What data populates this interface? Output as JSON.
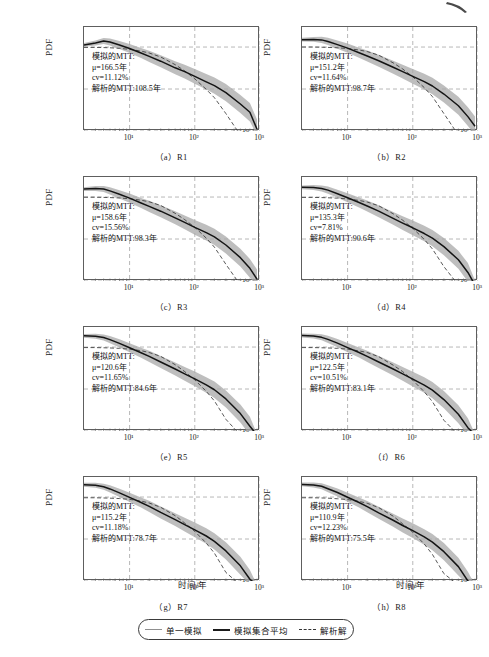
{
  "figure": {
    "axis": {
      "ylabel": "PDF",
      "xlabel": "时间/年",
      "yticks": [
        "10⁻²",
        "10⁻³",
        "10⁻⁴"
      ],
      "xticks": [
        "10¹",
        "10²",
        "10³"
      ],
      "xlim": [
        2,
        1000
      ],
      "ylim": [
        0.0001,
        0.03
      ],
      "grid": "dashed"
    },
    "annotation_labels": {
      "title": "模拟的MTT:",
      "mu_prefix": "μ=",
      "cv_prefix": "cv=",
      "analytic_prefix": "解析的MTT:",
      "unit_year": "年",
      "unit_percent": "%"
    },
    "legend": {
      "items": [
        {
          "label": "单一模拟",
          "style": "single-sim",
          "color": "#8f8f8f"
        },
        {
          "label": "模拟集合平均",
          "style": "ensemble-mean",
          "color": "#1b1b1b"
        },
        {
          "label": "解析解",
          "style": "analytic",
          "color": "#333333"
        }
      ]
    },
    "caption": ""
  },
  "chart_data": {
    "type": "line",
    "title": "",
    "xlabel": "时间/年",
    "ylabel": "PDF",
    "xscale": "log",
    "yscale": "log",
    "xlim": [
      2,
      1000
    ],
    "ylim": [
      0.0001,
      0.03
    ],
    "xticks": [
      10,
      100,
      1000
    ],
    "yticks": [
      0.01,
      0.001,
      0.0001
    ],
    "grid": true,
    "legend_position": "bottom-center",
    "series_types": [
      "单一模拟",
      "模拟集合平均",
      "解析解"
    ],
    "panels": [
      {
        "key": "a",
        "caption": "（a）R1",
        "region": "R1",
        "mtt_title": "模拟的MTT:",
        "mu": "166.5",
        "mu_text": "μ=166.5年",
        "cv": "11.12",
        "cv_text": "cv=11.12%",
        "analytic_mtt": "108.5",
        "analytic_text": "解析的MTT:108.5年",
        "x": [
          2,
          3,
          4,
          5,
          7,
          10,
          15,
          20,
          30,
          50,
          70,
          100,
          150,
          200,
          300,
          500,
          700,
          900
        ],
        "ensemble_mean": [
          0.0112,
          0.0125,
          0.014,
          0.0132,
          0.0112,
          0.0092,
          0.0072,
          0.006,
          0.0046,
          0.0032,
          0.0026,
          0.002,
          0.00148,
          0.0012,
          0.00082,
          0.00044,
          0.00028,
          0.00011
        ],
        "analytic": [
          0.0098,
          0.0098,
          0.0097,
          0.0096,
          0.0093,
          0.0088,
          0.008,
          0.0072,
          0.0058,
          0.0038,
          0.0027,
          0.00175,
          0.00098,
          0.00062,
          0.00026,
          6e-05,
          1.8e-05,
          5.5e-06
        ]
      },
      {
        "key": "b",
        "caption": "（b）R2",
        "region": "R2",
        "mtt_title": "模拟的MTT:",
        "mu": "151.2",
        "mu_text": "μ=151.2年",
        "cv": "11.64",
        "cv_text": "cv=11.64%",
        "analytic_mtt": "98.7",
        "analytic_text": "解析的MTT:98.7年",
        "x": [
          2,
          3,
          4,
          5,
          7,
          10,
          15,
          20,
          30,
          50,
          70,
          100,
          150,
          200,
          300,
          500,
          700,
          900
        ],
        "ensemble_mean": [
          0.015,
          0.0152,
          0.0148,
          0.0136,
          0.0114,
          0.0094,
          0.0073,
          0.0061,
          0.0047,
          0.0033,
          0.0026,
          0.002,
          0.0015,
          0.00118,
          0.00076,
          0.0004,
          0.00022,
          0.00013
        ],
        "analytic": [
          0.01,
          0.01,
          0.0099,
          0.0098,
          0.0096,
          0.0092,
          0.0085,
          0.0078,
          0.0064,
          0.0042,
          0.003,
          0.00195,
          0.00108,
          0.00066,
          0.00026,
          5e-05,
          1.4e-05,
          4.2e-06
        ]
      },
      {
        "key": "c",
        "caption": "（c）R3",
        "region": "R3",
        "mtt_title": "模拟的MTT:",
        "mu": "158.6",
        "mu_text": "μ=158.6年",
        "cv": "15.56",
        "cv_text": "cv=15.56%",
        "analytic_mtt": "98.3",
        "analytic_text": "解析的MTT:98.3年",
        "x": [
          2,
          3,
          4,
          5,
          7,
          10,
          15,
          20,
          30,
          50,
          70,
          100,
          150,
          200,
          300,
          500,
          700,
          900
        ],
        "ensemble_mean": [
          0.0155,
          0.016,
          0.0156,
          0.014,
          0.0116,
          0.0094,
          0.0072,
          0.006,
          0.0046,
          0.0032,
          0.0025,
          0.0019,
          0.00142,
          0.00112,
          0.00072,
          0.00036,
          0.0002,
          0.00011
        ],
        "analytic": [
          0.0099,
          0.0099,
          0.0098,
          0.0097,
          0.0095,
          0.0091,
          0.0084,
          0.0077,
          0.0063,
          0.0041,
          0.0029,
          0.0019,
          0.00105,
          0.00064,
          0.00025,
          4.8e-05,
          1.3e-05,
          4e-06
        ]
      },
      {
        "key": "d",
        "caption": "（d）R4",
        "region": "R4",
        "mtt_title": "模拟的MTT:",
        "mu": "135.3",
        "mu_text": "μ=135.3年",
        "cv": "7.81",
        "cv_text": "cv=7.81%",
        "analytic_mtt": "90.6",
        "analytic_text": "解析的MTT:90.6年",
        "x": [
          2,
          3,
          4,
          5,
          7,
          10,
          15,
          20,
          30,
          50,
          70,
          100,
          150,
          200,
          300,
          500,
          700,
          900
        ],
        "ensemble_mean": [
          0.017,
          0.0168,
          0.016,
          0.0146,
          0.012,
          0.0096,
          0.0074,
          0.0061,
          0.0046,
          0.0031,
          0.0024,
          0.00185,
          0.00135,
          0.00105,
          0.00066,
          0.00032,
          0.00016,
          6e-05
        ],
        "analytic": [
          0.0098,
          0.0098,
          0.0097,
          0.0096,
          0.0094,
          0.009,
          0.0083,
          0.0076,
          0.0062,
          0.004,
          0.0028,
          0.0018,
          0.00098,
          0.00058,
          0.00022,
          4e-05,
          1e-05,
          2.8e-06
        ]
      },
      {
        "key": "e",
        "caption": "（e）R5",
        "region": "R5",
        "mtt_title": "模拟的MTT:",
        "mu": "120.6",
        "mu_text": "μ=120.6年",
        "cv": "11.65",
        "cv_text": "cv=11.65%",
        "analytic_mtt": "84.6",
        "analytic_text": "解析的MTT:84.6年",
        "x": [
          2,
          3,
          4,
          5,
          7,
          10,
          15,
          20,
          30,
          50,
          70,
          100,
          150,
          200,
          300,
          500,
          700,
          900
        ],
        "ensemble_mean": [
          0.0185,
          0.018,
          0.0168,
          0.015,
          0.0122,
          0.0096,
          0.0073,
          0.006,
          0.0044,
          0.003,
          0.0023,
          0.00175,
          0.00125,
          0.00096,
          0.00058,
          0.00026,
          0.00013,
          5e-05
        ],
        "analytic": [
          0.0097,
          0.0097,
          0.0096,
          0.0095,
          0.0093,
          0.0089,
          0.0082,
          0.0074,
          0.006,
          0.0038,
          0.0026,
          0.00165,
          0.00088,
          0.00052,
          0.00019,
          3.2e-05,
          8.5e-06,
          2.2e-06
        ]
      },
      {
        "key": "f",
        "caption": "（f）R6",
        "region": "R6",
        "mtt_title": "模拟的MTT:",
        "mu": "122.5",
        "mu_text": "μ=122.5年",
        "cv": "10.51",
        "cv_text": "cv=10.51%",
        "analytic_mtt": "83.1",
        "analytic_text": "解析的MTT:83.1年",
        "x": [
          2,
          3,
          4,
          5,
          7,
          10,
          15,
          20,
          30,
          50,
          70,
          100,
          150,
          200,
          300,
          500,
          700,
          900
        ],
        "ensemble_mean": [
          0.0188,
          0.0182,
          0.017,
          0.0152,
          0.0124,
          0.0097,
          0.0074,
          0.006,
          0.0044,
          0.003,
          0.0023,
          0.00172,
          0.00124,
          0.00094,
          0.00056,
          0.00025,
          0.00012,
          5e-05
        ],
        "analytic": [
          0.0097,
          0.0097,
          0.0096,
          0.0095,
          0.0093,
          0.0089,
          0.0081,
          0.0074,
          0.0059,
          0.0037,
          0.0026,
          0.00162,
          0.00086,
          0.0005,
          0.00018,
          3e-05,
          8e-06,
          2e-06
        ]
      },
      {
        "key": "g",
        "caption": "（g）R7",
        "region": "R7",
        "mtt_title": "模拟的MTT:",
        "mu": "115.2",
        "mu_text": "μ=115.2年",
        "cv": "11.18",
        "cv_text": "cv=11.18%",
        "analytic_mtt": "78.7",
        "analytic_text": "解析的MTT:78.7年",
        "x": [
          2,
          3,
          4,
          5,
          7,
          10,
          15,
          20,
          30,
          50,
          70,
          100,
          150,
          200,
          300,
          500,
          700,
          900
        ],
        "ensemble_mean": [
          0.0196,
          0.019,
          0.0176,
          0.0156,
          0.0126,
          0.0098,
          0.0074,
          0.006,
          0.0043,
          0.0029,
          0.0022,
          0.00165,
          0.00118,
          0.00088,
          0.00052,
          0.00023,
          0.00011,
          4e-05
        ],
        "analytic": [
          0.0096,
          0.0096,
          0.0095,
          0.0094,
          0.0092,
          0.0088,
          0.008,
          0.0072,
          0.0057,
          0.0036,
          0.0024,
          0.00152,
          0.0008,
          0.00046,
          0.00016,
          2.6e-05,
          6.8e-06,
          1.8e-06
        ]
      },
      {
        "key": "h",
        "caption": "（h）R8",
        "region": "R8",
        "mtt_title": "模拟的MTT:",
        "mu": "110.9",
        "mu_text": "μ=110.9年",
        "cv": "12.23",
        "cv_text": "cv=12.23%",
        "analytic_mtt": "75.5",
        "analytic_text": "解析的MTT:75.5年",
        "x": [
          2,
          3,
          4,
          5,
          7,
          10,
          15,
          20,
          30,
          50,
          70,
          100,
          150,
          200,
          300,
          500,
          700,
          900
        ],
        "ensemble_mean": [
          0.02,
          0.0194,
          0.018,
          0.0158,
          0.0128,
          0.0099,
          0.0074,
          0.0059,
          0.0042,
          0.0028,
          0.0021,
          0.00158,
          0.00112,
          0.00084,
          0.0005,
          0.00022,
          0.0001,
          4e-05
        ],
        "analytic": [
          0.0096,
          0.0096,
          0.0095,
          0.0094,
          0.0091,
          0.0087,
          0.0079,
          0.0071,
          0.0056,
          0.0035,
          0.0023,
          0.00145,
          0.00076,
          0.00043,
          0.00015,
          2.3e-05,
          6e-06,
          1.5e-06
        ]
      }
    ]
  }
}
